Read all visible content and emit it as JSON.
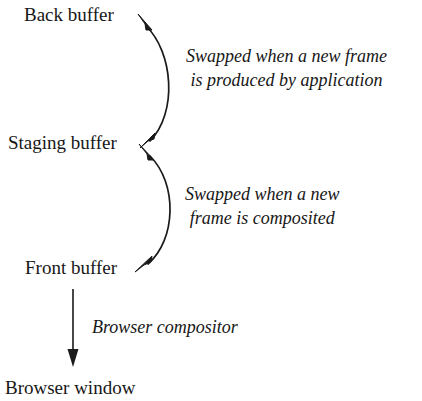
{
  "diagram": {
    "background_color": "#ffffff",
    "stroke_color": "#1a1a1a",
    "nodes": [
      {
        "id": "back_buffer",
        "label": "Back buffer"
      },
      {
        "id": "staging_buffer",
        "label": "Staging buffer"
      },
      {
        "id": "front_buffer",
        "label": "Front buffer"
      },
      {
        "id": "browser_window",
        "label": "Browser window"
      }
    ],
    "edges": [
      {
        "id": "edge_back_staging",
        "from": "staging_buffer",
        "to": "back_buffer",
        "style": "curved",
        "arrowheads": "both",
        "label_line_1": "Swapped when a new frame",
        "label_line_2": "is produced by application"
      },
      {
        "id": "edge_staging_front",
        "from": "staging_buffer",
        "to": "front_buffer",
        "style": "curved",
        "arrowheads": "both",
        "label_line_1": "Swapped when a new",
        "label_line_2": "frame is composited"
      },
      {
        "id": "edge_front_window",
        "from": "front_buffer",
        "to": "browser_window",
        "style": "straight",
        "arrowheads": "end",
        "label_line_1": "Browser compositor",
        "label_line_2": ""
      }
    ]
  }
}
